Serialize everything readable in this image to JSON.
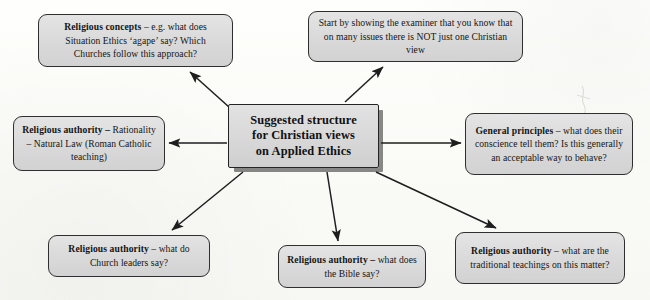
{
  "diagram": {
    "title": "Suggested structure for Christian views on Applied Ethics",
    "hub": {
      "line1": "Suggested structure",
      "line2": "for Christian views",
      "line3": "on Applied Ethics"
    },
    "nodes": {
      "concepts": {
        "lead": "Religious concepts",
        "body": " – e.g. what does Situation Ethics ‘agape’ say? Which Churches follow this approach?"
      },
      "start": {
        "lead": "",
        "body": "Start by showing the examiner that you know that on many issues there is NOT just one Christian view"
      },
      "rationality": {
        "lead": "Religious authority –",
        "body": " Rationality – Natural Law (Roman Catholic teaching)"
      },
      "general": {
        "lead": "General principles",
        "body": " – what does their conscience tell them? Is this generally an acceptable way to behave?"
      },
      "leaders": {
        "lead": "Religious authority",
        "body": " – what do Church leaders say?"
      },
      "bible": {
        "lead": "Religious authority –",
        "body": " what does the Bible say?"
      },
      "traditional": {
        "lead": "Religious authority",
        "body": " – what are the traditional teachings on this matter?"
      }
    },
    "colors": {
      "box_fill": "#dddddd",
      "box_border": "#2f2f2f",
      "arrow": "#1e1e1e",
      "page_background": "#fcfcfa",
      "text": "#151515"
    }
  }
}
